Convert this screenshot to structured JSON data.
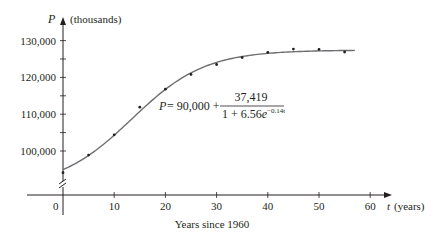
{
  "chart_data": {
    "type": "scatter",
    "title": "",
    "xlabel": "Years since 1960",
    "x_axis_var": "t",
    "x_axis_unit": "(years)",
    "ylabel": "P",
    "y_axis_unit": "(thousands)",
    "xlim": [
      0,
      60
    ],
    "ylim": [
      90000,
      132000
    ],
    "y_axis_break": true,
    "grid": false,
    "legend": null,
    "x_ticks": [
      0,
      10,
      20,
      30,
      40,
      50,
      60
    ],
    "x_tick_labels": [
      "0",
      "10",
      "20",
      "30",
      "40",
      "50",
      "60"
    ],
    "y_ticks": [
      100000,
      105000,
      110000,
      115000,
      120000,
      125000,
      130000
    ],
    "y_tick_labels": [
      "100,000",
      "",
      "110,000",
      "",
      "120,000",
      "",
      "130,000"
    ],
    "series": [
      {
        "name": "Observed population",
        "kind": "scatter",
        "x": [
          0,
          5,
          10,
          15,
          20,
          25,
          30,
          35,
          40,
          45,
          50,
          55
        ],
        "y": [
          94100,
          98900,
          104400,
          111900,
          116800,
          120800,
          123500,
          125400,
          126800,
          127700,
          127600,
          126900
        ]
      },
      {
        "name": "Logistic model",
        "kind": "line",
        "formula": "P = 90,000 + 37,419 / (1 + 6.56e^(-0.14t))",
        "params": {
          "M_offset": 90000,
          "A": 37419,
          "B": 6.56,
          "k": 0.14
        },
        "x_range": [
          0,
          57
        ]
      }
    ],
    "annotations": [
      {
        "text_lhs": "P = 90,000 +",
        "numerator": "37,419",
        "denominator_base": "1 + 6.56e",
        "denominator_exp": "−0.14t"
      }
    ]
  },
  "labels": {
    "y_var": "P",
    "y_unit": "(thousands)",
    "x_var": "t",
    "x_unit": "(years)",
    "x_caption": "Years since 1960",
    "origin": "0",
    "eq_lhs": "P",
    "eq_mid": " = 90,000 +",
    "eq_num": "37,419",
    "eq_den": "1 + 6.56",
    "eq_den_e": "e",
    "eq_den_exp": "−0.14t"
  }
}
